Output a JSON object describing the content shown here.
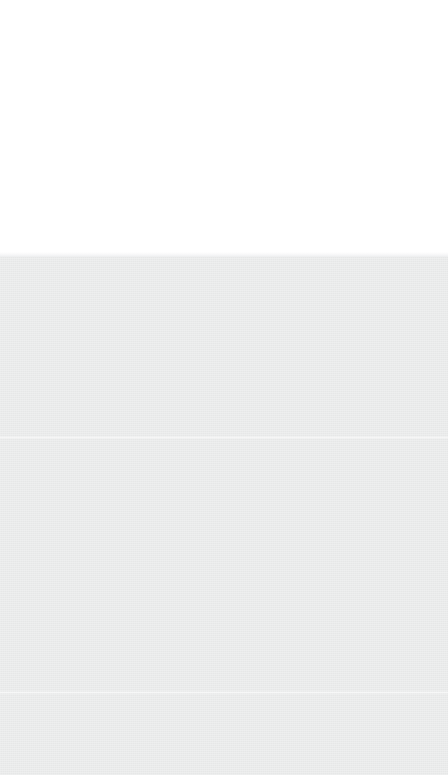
{
  "screen": {
    "width": 775,
    "height": 775,
    "description": "Blank viewport screenshot with no rendered UI content",
    "state": "empty"
  },
  "regions": {
    "white_band": {
      "name": "upper-blank-white-area",
      "color": "#ffffff",
      "top": 0,
      "height": 254,
      "content": ""
    },
    "gray_body": {
      "name": "lower-blank-gray-area",
      "color": "#e9eaea",
      "top": 257,
      "height": 518,
      "content": ""
    }
  },
  "seams": [
    {
      "name": "band-transition-gradient",
      "y": 252,
      "color": "#eeeff0"
    },
    {
      "name": "faint-horizontal-seam-upper",
      "y": 436,
      "color": "#edeeee"
    },
    {
      "name": "faint-horizontal-seam-lower",
      "y": 691,
      "color": "#edeeee"
    }
  ],
  "colors": {
    "white": "#ffffff",
    "gray": "#e9eaea",
    "seam": "#edeeee"
  },
  "text": {
    "none": ""
  }
}
